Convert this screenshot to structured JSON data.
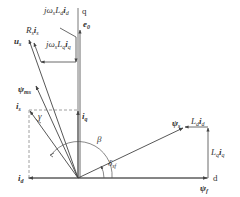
{
  "diagram": {
    "type": "phasor-diagram",
    "title": "",
    "colors": {
      "line": "#444444",
      "dashed": "#888888",
      "text": "#333333",
      "background": "#ffffff"
    },
    "axes": {
      "d": {
        "label": "d"
      },
      "q": {
        "label": "q"
      }
    },
    "labels": {
      "jw_Ld_id": {
        "main": "jω",
        "s1": "s",
        "L": "L",
        "s2": "d",
        "i": "i",
        "s3": "d"
      },
      "jw_Lq_iq": {
        "main": "jω",
        "s1": "s",
        "L": "L",
        "s2": "q",
        "i": "i",
        "s3": "q"
      },
      "Rs_is": {
        "main": "R",
        "s1": "s",
        "i": "i",
        "s2": "s"
      },
      "us": {
        "main": "u",
        "s1": "s"
      },
      "e0": {
        "main": "e",
        "s1": "0"
      },
      "psi_ms": {
        "main": "ψ",
        "s1": "ms"
      },
      "is": {
        "main": "i",
        "s1": "s"
      },
      "iq": {
        "main": "i",
        "s1": "q"
      },
      "id": {
        "main": "i",
        "s1": "d"
      },
      "gamma": {
        "main": "γ"
      },
      "beta": {
        "main": "β"
      },
      "delta_sf": {
        "main": "δ",
        "s1": "sf"
      },
      "psi_s": {
        "main": "ψ",
        "s1": "s"
      },
      "Ld_id": {
        "L": "L",
        "s1": "d",
        "i": "i",
        "s2": "d"
      },
      "Lq_iq": {
        "L": "L",
        "s1": "q",
        "i": "i",
        "s2": "q"
      },
      "psi_f": {
        "main": "ψ",
        "s1": "f"
      }
    },
    "vectors": [
      {
        "name": "psi_f",
        "from": "origin",
        "direction": "d-axis"
      },
      {
        "name": "i_d",
        "from": "origin",
        "direction": "-d"
      },
      {
        "name": "i_q",
        "from": "origin",
        "direction": "+q"
      },
      {
        "name": "i_s",
        "from": "origin",
        "direction": "second-quadrant"
      },
      {
        "name": "psi_ms",
        "from": "origin",
        "direction": "second-quadrant"
      },
      {
        "name": "u_s",
        "from": "origin",
        "direction": "second-quadrant"
      },
      {
        "name": "e_0",
        "from": "origin",
        "direction": "+q"
      },
      {
        "name": "psi_s",
        "from": "origin",
        "direction": "first-quadrant"
      },
      {
        "name": "Lq_iq",
        "from": "psi_f-tip",
        "direction": "+q"
      },
      {
        "name": "Ld_id",
        "from": "Lq_iq-tip",
        "direction": "-d"
      },
      {
        "name": "jws_Lq_iq",
        "from": "e0-tip",
        "direction": "-d"
      },
      {
        "name": "jws_Ld_id",
        "from": "q-axis",
        "direction": "diagonal"
      },
      {
        "name": "Rs_is",
        "from": "jws_Lq_iq-tip",
        "direction": "to-us"
      }
    ]
  }
}
